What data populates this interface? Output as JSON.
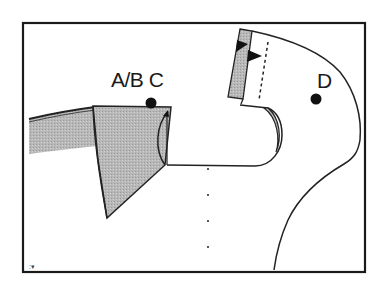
{
  "figure": {
    "labels": {
      "ab_c": "A/B C",
      "d": "D",
      "corner_mark": ":▾"
    },
    "colors": {
      "frame": "#1a1a1a",
      "fill_gray": "#b3b3b3",
      "stroke": "#222222",
      "background": "#ffffff",
      "marker": "#111111"
    },
    "markers": [
      {
        "id": "point-abc",
        "label": "A/B C",
        "x": 151,
        "y": 103
      },
      {
        "id": "point-d",
        "label": "D",
        "x": 316,
        "y": 99
      }
    ]
  }
}
